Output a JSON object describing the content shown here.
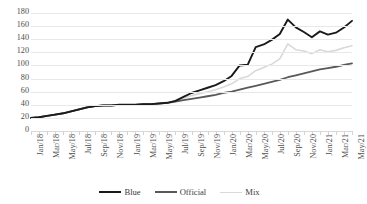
{
  "chart_data": {
    "type": "line",
    "title": "",
    "xlabel": "",
    "ylabel": "",
    "ylim": [
      0,
      180
    ],
    "ytick_step": 20,
    "yticks": [
      180,
      160,
      140,
      120,
      100,
      80,
      60,
      40,
      20,
      0
    ],
    "grid": true,
    "legend_position": "bottom",
    "x_tick_labels": [
      "Jan/18",
      "Mar/18",
      "May/18",
      "Jul/18",
      "Sep/18",
      "Nov/18",
      "Jan/19",
      "Mar/19",
      "May/19",
      "Jul/19",
      "Sep/19",
      "Nov/19",
      "Jan/20",
      "Mar/20",
      "May/20",
      "Jul/20",
      "Sep/20",
      "Nov/20",
      "Jan/21",
      "Mar/21",
      "May/21"
    ],
    "x": [
      "Jan/18",
      "Feb/18",
      "Mar/18",
      "Apr/18",
      "May/18",
      "Jun/18",
      "Jul/18",
      "Aug/18",
      "Sep/18",
      "Oct/18",
      "Nov/18",
      "Dec/18",
      "Jan/19",
      "Feb/19",
      "Mar/19",
      "Apr/19",
      "May/19",
      "Jun/19",
      "Jul/19",
      "Aug/19",
      "Sep/19",
      "Oct/19",
      "Nov/19",
      "Dec/19",
      "Jan/20",
      "Feb/20",
      "Mar/20",
      "Apr/20",
      "May/20",
      "Jun/20",
      "Jul/20",
      "Aug/20",
      "Sep/20",
      "Oct/20",
      "Nov/20",
      "Dec/20",
      "Jan/21",
      "Feb/21",
      "Mar/21",
      "Apr/21",
      "May/21"
    ],
    "series": [
      {
        "name": "Blue",
        "color": "#1a1a1a",
        "width": 1.9,
        "values": [
          20,
          21,
          23,
          25,
          27,
          30,
          33,
          36,
          38,
          39,
          39,
          40,
          40,
          40,
          41,
          41,
          42,
          43,
          46,
          52,
          58,
          62,
          66,
          70,
          76,
          84,
          100,
          101,
          128,
          132,
          139,
          148,
          170,
          158,
          151,
          143,
          152,
          147,
          150,
          158,
          168
        ]
      },
      {
        "name": "Official",
        "color": "#595959",
        "width": 1.8,
        "values": [
          20,
          21,
          23,
          25,
          27,
          30,
          33,
          36,
          38,
          39,
          39,
          40,
          40,
          40,
          41,
          41,
          42,
          43,
          45,
          47,
          49,
          51,
          53,
          55,
          58,
          60,
          63,
          66,
          69,
          72,
          75,
          78,
          82,
          85,
          88,
          91,
          94,
          96,
          98,
          101,
          103
        ]
      },
      {
        "name": "Mix",
        "color": "#d9d9d9",
        "width": 1.6,
        "values": [
          20,
          21,
          23,
          25,
          27,
          30,
          33,
          36,
          38,
          39,
          39,
          40,
          40,
          40,
          41,
          41,
          42,
          43,
          46,
          50,
          54,
          57,
          60,
          63,
          67,
          72,
          80,
          83,
          92,
          97,
          102,
          110,
          133,
          124,
          122,
          118,
          124,
          121,
          123,
          127,
          130
        ]
      }
    ]
  },
  "legend": {
    "items": [
      {
        "label": "Blue",
        "color": "#1a1a1a",
        "width": 2.6
      },
      {
        "label": "Official",
        "color": "#595959",
        "width": 2.2
      },
      {
        "label": "Mix",
        "color": "#d9d9d9",
        "width": 1.5
      }
    ]
  }
}
